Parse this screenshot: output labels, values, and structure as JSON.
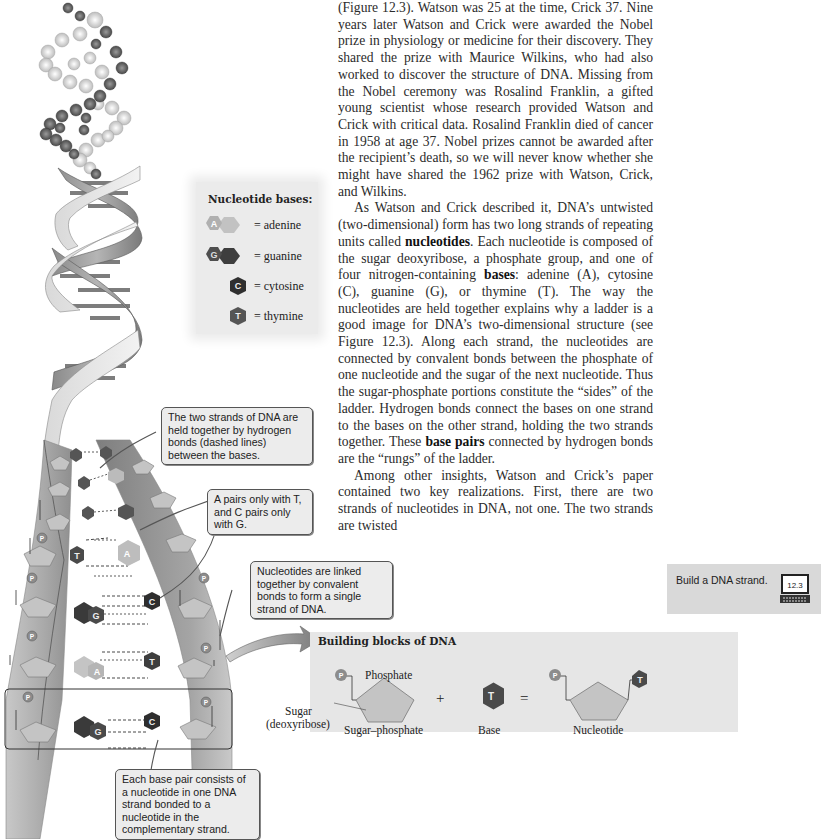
{
  "body_text": {
    "paragraph_1": "(Figure 12.3). Watson was 25 at the time, Crick 37. Nine years later Watson and Crick were awarded the Nobel prize in physiology or medicine for their discovery. They shared the prize with Maurice Wilkins, who had also worked to discover the structure of DNA. Missing from the Nobel ceremony was Rosalind Franklin, a gifted young scientist whose research provided Watson and Crick with critical data. Rosalind Franklin died of cancer in 1958 at age 37. Nobel prizes cannot be awarded after the recipient’s death, so we will never know whether she might have shared the 1962 prize with Watson, Crick, and Wilkins.",
    "paragraph_2_a": "As Watson and Crick described it, DNA’s untwisted (two-dimensional) form has two long strands of repeating units called ",
    "paragraph_2_term1": "nucleotides",
    "paragraph_2_b": ". Each nucleotide is composed of the sugar deoxyribose, a phosphate group, and one of four nitrogen-containing ",
    "paragraph_2_term2": "bases",
    "paragraph_2_c": ": adenine (A), cytosine (C), guanine (G), or thymine (T). The way the nucleotides are held together explains why a ladder is a good image for DNA’s two-dimensional structure (see Figure 12.3). Along each strand, the nucleotides are connected by convalent bonds between the phosphate of one nucleotide and the sugar of the next nucleotide. Thus the sugar-phosphate portions constitute the “sides” of the ladder. Hydrogen bonds connect the bases on one strand to the bases on the other strand, holding the two strands together. These ",
    "paragraph_2_term3": "base pairs",
    "paragraph_2_d": " connected by hydrogen bonds are the “rungs” of the ladder.",
    "paragraph_3": "Among other insights, Watson and Crick’s paper contained two key realizations. First, there are two strands of nucleotides in DNA, not one. The two strands are twisted"
  },
  "legend": {
    "title": "Nucleotide bases:",
    "items": [
      {
        "letter": "A",
        "label": "= adenine",
        "color": "#b9b9b9"
      },
      {
        "letter": "G",
        "label": "= guanine",
        "color": "#4a4a4a"
      },
      {
        "letter": "C",
        "label": "= cytosine",
        "color": "#333333"
      },
      {
        "letter": "T",
        "label": "= thymine",
        "color": "#5a5a5a"
      }
    ]
  },
  "callouts": {
    "hydrogen_bonds": "The two strands of DNA are held together by hydrogen bonds (dashed lines) between the bases.",
    "pairing": "A pairs only with T, and C pairs only with G.",
    "covalent": "Nucleotides are linked together by convalent bonds to form a single strand of DNA.",
    "base_pair": "Each base pair consists of a nucleotide in one DNA strand bonded to a nucleotide in the complementary strand."
  },
  "ladder": {
    "phosphate_label": "P",
    "rungs": [
      {
        "left": "T",
        "right": "A"
      },
      {
        "left": "G",
        "right": "C"
      },
      {
        "left": "A",
        "right": "T"
      },
      {
        "left": "G",
        "right": "C"
      }
    ]
  },
  "building_blocks": {
    "title": "Building blocks of DNA",
    "phosphate": "Phosphate",
    "sugar": "Sugar",
    "sugar_sub": "(deoxyribose)",
    "sugar_phosphate": "Sugar–phosphate",
    "plus": "+",
    "equals": "=",
    "base_letter": "T",
    "base": "Base",
    "nucleotide": "Nucleotide",
    "p": "P"
  },
  "sidebar": {
    "activity_label": "Build a DNA strand.",
    "activity_number": "12.3"
  }
}
